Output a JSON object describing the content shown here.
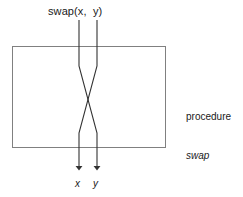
{
  "diagram": {
    "type": "flow-swap-procedure",
    "call_label": "swap(x,  y)",
    "outputs": [
      {
        "name": "output-label-x",
        "text": "x"
      },
      {
        "name": "output-label-y",
        "text": "y"
      }
    ],
    "side_caption": {
      "keyword": "procedure",
      "name": "swap"
    },
    "colors": {
      "box_border": "#808080",
      "line": "#333333",
      "text": "#1a1a1a",
      "background": "#ffffff"
    },
    "geometry": {
      "box": {
        "x": 12,
        "y": 46,
        "width": 154,
        "height": 102
      },
      "left_wire_x": 79,
      "right_wire_x": 97,
      "wire_top_y": 20,
      "diverge_y": 66,
      "cross_y": 99,
      "converge_y": 133,
      "arrow_tip_y": 175
    }
  }
}
